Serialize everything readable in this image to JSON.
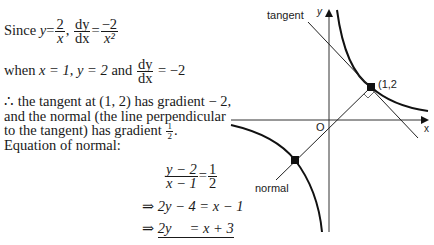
{
  "text": {
    "line1_since": "Since",
    "line1_y": "y",
    "line1_eq": "=",
    "line1_frac1_num": "2",
    "line1_frac1_den": "x",
    "line1_comma": ",",
    "line1_dy": "dy",
    "line1_dx": "dx",
    "line1_eq2": "=",
    "line1_frac2_num": "−2",
    "line1_frac2_den": "x²",
    "line2_prefix": "when",
    "line2_cond": "x = 1, y = 2",
    "line2_and": "and",
    "line2_dy": "dy",
    "line2_dx": "dx",
    "line2_value": "= −2",
    "line3": "∴ the tangent at (1, 2) has gradient − 2,",
    "line4": "and the normal (the line perpendicular",
    "line5_a": "to the tangent) has gradient",
    "line5_half_num": "1",
    "line5_half_den": "2",
    "line5_end": ".",
    "line6": "Equation of normal:",
    "eq1_num": "y − 2",
    "eq1_den": "x − 1",
    "eq1_eq": "=",
    "eq1_rnum": "1",
    "eq1_rden": "2",
    "eq2": "⇒ 2y − 4 = x − 1",
    "eq3_arrow": "⇒",
    "eq3_lhs": "2y",
    "eq3_rhs": "= x + 3"
  },
  "diagram": {
    "label_tangent": "tangent",
    "label_normal": "normal",
    "label_y": "y",
    "label_x": "x",
    "label_origin": "O",
    "label_point": "(1,2"
  }
}
